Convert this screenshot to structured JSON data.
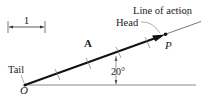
{
  "figure": {
    "scale_label": "1",
    "vector_label": "A",
    "head_label": "Head",
    "tail_label": "Tail",
    "line_of_action_label": "Line of action",
    "point_p_label": "P",
    "origin_label": "O",
    "angle_label": "20°",
    "angle_degrees": 20,
    "vector_length_units": 4.5
  }
}
